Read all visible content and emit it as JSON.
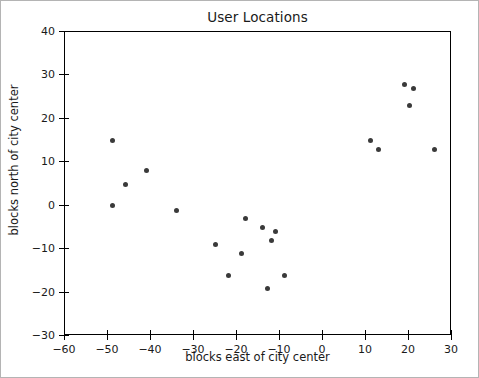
{
  "chart_data": {
    "type": "scatter",
    "title": "User Locations",
    "xlabel": "blocks east of city center",
    "ylabel": "blocks north of city center",
    "xlim": [
      -60,
      30
    ],
    "ylim": [
      -30,
      40
    ],
    "xticks": [
      -60,
      -50,
      -40,
      -30,
      -20,
      -10,
      0,
      10,
      20,
      30
    ],
    "yticks": [
      -30,
      -20,
      -10,
      0,
      10,
      20,
      30,
      40
    ],
    "xticklabels": [
      "−60",
      "−50",
      "−40",
      "−30",
      "−20",
      "−10",
      "0",
      "10",
      "20",
      "30"
    ],
    "yticklabels": [
      "−30",
      "−20",
      "−10",
      "0",
      "10",
      "20",
      "30",
      "40"
    ],
    "grid": false,
    "legend": null,
    "marker_color": "#3a3a3a",
    "marker_size": 5,
    "x": [
      -49,
      -46,
      -41,
      -49,
      -34,
      -25,
      -22,
      -19,
      -18,
      -14,
      -13,
      -12,
      -11,
      -9,
      11,
      13,
      19,
      21,
      20,
      26
    ],
    "y": [
      15,
      5,
      8,
      0,
      -1,
      -9,
      -16,
      -11,
      -3,
      -5,
      -19,
      -8,
      -6,
      -16,
      15,
      13,
      28,
      27,
      23,
      13
    ],
    "points": [
      {
        "x": -49,
        "y": 15
      },
      {
        "x": -46,
        "y": 5
      },
      {
        "x": -41,
        "y": 8
      },
      {
        "x": -49,
        "y": 0
      },
      {
        "x": -34,
        "y": -1
      },
      {
        "x": -25,
        "y": -9
      },
      {
        "x": -22,
        "y": -16
      },
      {
        "x": -19,
        "y": -11
      },
      {
        "x": -18,
        "y": -3
      },
      {
        "x": -14,
        "y": -5
      },
      {
        "x": -13,
        "y": -19
      },
      {
        "x": -12,
        "y": -8
      },
      {
        "x": -11,
        "y": -6
      },
      {
        "x": -9,
        "y": -16
      },
      {
        "x": 11,
        "y": 15
      },
      {
        "x": 13,
        "y": 13
      },
      {
        "x": 19,
        "y": 28
      },
      {
        "x": 21,
        "y": 27
      },
      {
        "x": 20,
        "y": 23
      },
      {
        "x": 26,
        "y": 13
      }
    ]
  },
  "figure": {
    "background": "#ffffff",
    "border_color": "#b4b4b4",
    "axes_border_color": "#000000"
  }
}
